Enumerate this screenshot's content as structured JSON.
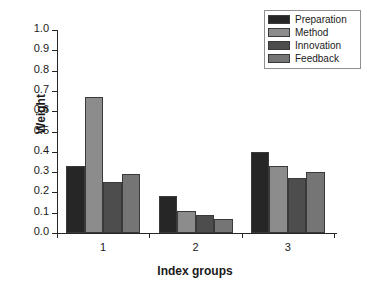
{
  "chart_data": {
    "type": "bar",
    "title": "",
    "xlabel": "Index groups",
    "ylabel": "Weight",
    "categories": [
      "1",
      "2",
      "3"
    ],
    "ylim": [
      0.0,
      1.0
    ],
    "ytick_labels": [
      "0.0",
      "0.1",
      "0.2",
      "0.3",
      "0.4",
      "0.5",
      "0.6",
      "0.7",
      "0.8",
      "0.9",
      "1.0"
    ],
    "ytick_values": [
      0.0,
      0.1,
      0.2,
      0.3,
      0.4,
      0.5,
      0.6,
      0.7,
      0.8,
      0.9,
      1.0
    ],
    "grid": false,
    "legend_position": "top-right",
    "series": [
      {
        "name": "Preparation",
        "color": "#262626",
        "values": [
          0.33,
          0.18,
          0.4
        ]
      },
      {
        "name": "Method",
        "color": "#8c8c8c",
        "values": [
          0.67,
          0.11,
          0.33
        ]
      },
      {
        "name": "Innovation",
        "color": "#4d4d4d",
        "values": [
          0.25,
          0.09,
          0.27
        ]
      },
      {
        "name": "Feedback",
        "color": "#757575",
        "values": [
          0.29,
          0.07,
          0.3
        ]
      }
    ]
  }
}
